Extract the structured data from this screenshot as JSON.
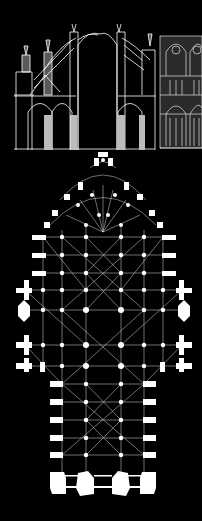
{
  "figure": {
    "panels": [
      {
        "id": "section",
        "label": "Cross-section with flying buttresses"
      },
      {
        "id": "elevation",
        "label": "Partial facade/nave elevation"
      },
      {
        "id": "plan",
        "label": "Ground floor plan with rib vaulting"
      }
    ],
    "colors": {
      "background": "#000000",
      "lines": "#ffffff",
      "grey_fill": "#b9b9b9"
    }
  }
}
